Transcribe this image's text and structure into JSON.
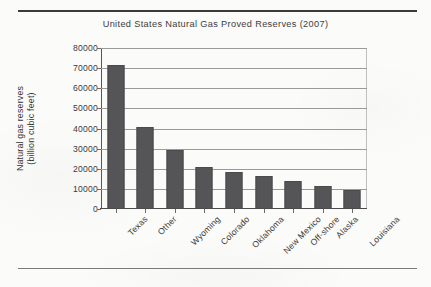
{
  "figure": {
    "name": "bar-chart-figure",
    "rules": {
      "top": "horizontal-rule",
      "bottom": "horizontal-rule"
    }
  },
  "chart_data": {
    "type": "bar",
    "title": "United States Natural Gas Proved Reserves (2007)",
    "xlabel": "",
    "ylabel": "Natural gas reserves (billion cubic feet)",
    "ylabel_line1": "Natural gas reserves",
    "ylabel_line2": "(billion cubic feet)",
    "categories": [
      "Texas",
      "Other",
      "Wyoming",
      "Colorado",
      "Oklahoma",
      "New Mexico",
      "Off-shore",
      "Alaska",
      "Louisiana"
    ],
    "values": [
      71500,
      41000,
      29500,
      21000,
      18500,
      16500,
      14000,
      11500,
      9500
    ],
    "ylim": [
      0,
      80000
    ],
    "yticks": [
      0,
      10000,
      20000,
      30000,
      40000,
      50000,
      60000,
      70000,
      80000
    ],
    "ytick_labels": [
      "0",
      "10000",
      "20000",
      "30000",
      "40000",
      "50000",
      "60000",
      "70000",
      "80000"
    ],
    "grid": "horizontal",
    "legend": "none",
    "bar_color": "#555456",
    "grid_color": "#9a9a9a",
    "axis_color": "#4a4a4a",
    "text_color": "#3a3a3a"
  }
}
